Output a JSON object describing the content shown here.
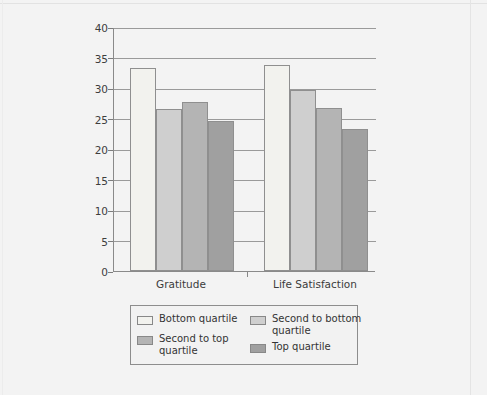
{
  "chart_data": {
    "type": "bar",
    "title": "",
    "xlabel": "",
    "ylabel": "",
    "categories": [
      "Gratitude",
      "Life Satisfaction"
    ],
    "series": [
      {
        "name": "Bottom quartile",
        "color": "#f2f2ee",
        "values": [
          33.3,
          33.8
        ]
      },
      {
        "name": "Second to bottom quartile",
        "color": "#cfcfcf",
        "values": [
          26.5,
          29.7
        ]
      },
      {
        "name": "Second to top quartile",
        "color": "#b4b4b4",
        "values": [
          27.7,
          26.8
        ]
      },
      {
        "name": "Top quartile",
        "color": "#a0a0a0",
        "values": [
          24.6,
          23.2
        ]
      }
    ],
    "ylim": [
      0,
      40
    ],
    "ytick_step": 5,
    "yticks": [
      "40",
      "35",
      "30",
      "25",
      "20",
      "15",
      "10",
      "5",
      "0"
    ],
    "grid": true,
    "legend_position": "bottom"
  },
  "legend": {
    "entries": [
      {
        "label": "Bottom quartile"
      },
      {
        "label": "Second to bottom quartile"
      },
      {
        "label": "Second to top quartile"
      },
      {
        "label": "Top quartile"
      }
    ]
  }
}
